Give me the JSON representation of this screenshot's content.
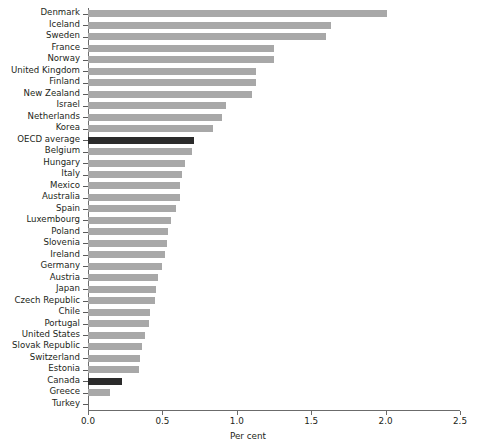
{
  "chart_data": {
    "type": "bar",
    "orientation": "horizontal",
    "title": "",
    "xlabel": "Per cent",
    "ylabel": "",
    "xlim": [
      0.0,
      2.5
    ],
    "xticks": [
      "0.0",
      "0.5",
      "1.0",
      "1.5",
      "2.0",
      "2.5"
    ],
    "xtick_values": [
      0.0,
      0.5,
      1.0,
      1.5,
      2.0,
      2.5
    ],
    "grid": false,
    "legend": "none",
    "bar_color": "#a8a8a8",
    "highlight_color": "#2b2b2b",
    "highlighted_categories": [
      "OECD average",
      "Canada"
    ],
    "categories": [
      "Denmark",
      "Iceland",
      "Sweden",
      "France",
      "Norway",
      "United Kingdom",
      "Finland",
      "New Zealand",
      "Israel",
      "Netherlands",
      "Korea",
      "OECD average",
      "Belgium",
      "Hungary",
      "Italy",
      "Mexico",
      "Australia",
      "Spain",
      "Luxembourg",
      "Poland",
      "Slovenia",
      "Ireland",
      "Germany",
      "Austria",
      "Japan",
      "Czech Republic",
      "Chile",
      "Portugal",
      "United States",
      "Slovak Republic",
      "Switzerland",
      "Estonia",
      "Canada",
      "Greece",
      "Turkey"
    ],
    "values": [
      2.01,
      1.63,
      1.6,
      1.25,
      1.25,
      1.13,
      1.13,
      1.1,
      0.93,
      0.9,
      0.84,
      0.71,
      0.7,
      0.65,
      0.63,
      0.62,
      0.62,
      0.59,
      0.56,
      0.54,
      0.53,
      0.52,
      0.5,
      0.47,
      0.46,
      0.45,
      0.42,
      0.41,
      0.38,
      0.36,
      0.35,
      0.34,
      0.23,
      0.15,
      0.0
    ]
  }
}
